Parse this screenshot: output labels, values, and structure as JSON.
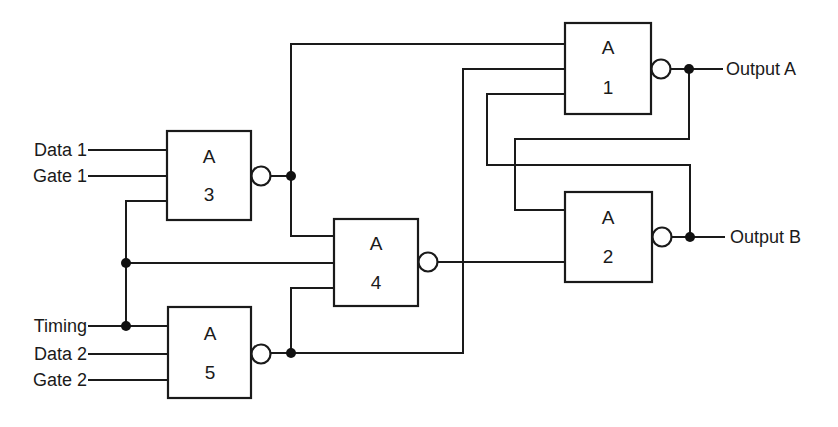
{
  "diagram": {
    "type": "logic-circuit",
    "gates": [
      {
        "id": "1",
        "type_label": "A",
        "number": "1"
      },
      {
        "id": "2",
        "type_label": "A",
        "number": "2"
      },
      {
        "id": "3",
        "type_label": "A",
        "number": "3"
      },
      {
        "id": "4",
        "type_label": "A",
        "number": "4"
      },
      {
        "id": "5",
        "type_label": "A",
        "number": "5"
      }
    ],
    "inputs": {
      "data1": "Data 1",
      "gate1": "Gate 1",
      "timing": "Timing",
      "data2": "Data 2",
      "gate2": "Gate 2"
    },
    "outputs": {
      "a": "Output A",
      "b": "Output B"
    },
    "colors": {
      "line": "#1a1a1a",
      "background": "#ffffff"
    }
  }
}
